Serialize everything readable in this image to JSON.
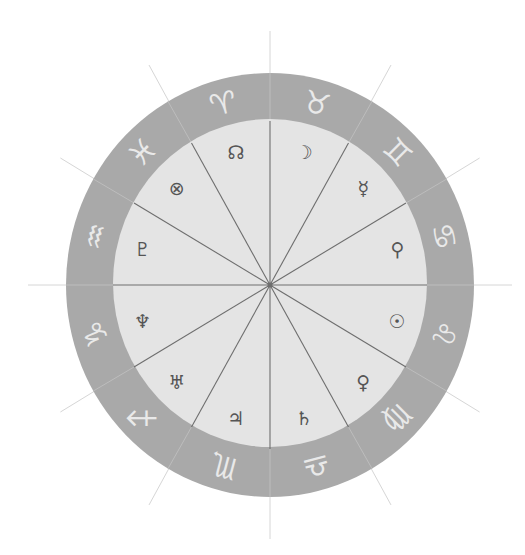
{
  "chart": {
    "center": {
      "x": 270,
      "y": 285
    },
    "outer_radius_x": 204,
    "outer_radius_y": 212,
    "inner_radius_x": 157,
    "inner_radius_y": 164,
    "tick_outer_radius_x": 242,
    "tick_outer_radius_y": 254,
    "colors": {
      "background": "#ffffff",
      "ring": "#a9a9a9",
      "inner_disk": "#e4e4e4",
      "spoke": "#6e6e6e",
      "tick": "#d6d6d6",
      "ring_divider": "#bdbdbd",
      "sign_glyph": "#e9e9e9",
      "body_glyph": "#555555"
    }
  },
  "zodiac_signs": [
    {
      "name": "aries",
      "glyph": "♈",
      "angle": -15
    },
    {
      "name": "taurus",
      "glyph": "♉",
      "angle": 15
    },
    {
      "name": "gemini",
      "glyph": "♊",
      "angle": 45
    },
    {
      "name": "cancer",
      "glyph": "♋",
      "angle": 75
    },
    {
      "name": "leo",
      "glyph": "♌",
      "angle": 105
    },
    {
      "name": "virgo",
      "glyph": "♍",
      "angle": 135
    },
    {
      "name": "libra",
      "glyph": "♎",
      "angle": 165
    },
    {
      "name": "scorpio",
      "glyph": "♏",
      "angle": 195
    },
    {
      "name": "sagittarius",
      "glyph": "♐",
      "angle": 225
    },
    {
      "name": "capricorn",
      "glyph": "♑",
      "angle": 255
    },
    {
      "name": "aquarius",
      "glyph": "♒",
      "angle": 285
    },
    {
      "name": "pisces",
      "glyph": "♓",
      "angle": 315
    }
  ],
  "houses": [
    {
      "name": "north-node",
      "glyph": "☊",
      "angle": -15
    },
    {
      "name": "moon",
      "glyph": "☽",
      "angle": 15
    },
    {
      "name": "mercury-variant",
      "glyph": "☿",
      "angle": 45
    },
    {
      "name": "venus-variant",
      "glyph": "⚲",
      "angle": 75
    },
    {
      "name": "sun",
      "glyph": "☉",
      "angle": 105
    },
    {
      "name": "venus-arrow",
      "glyph": "♀",
      "angle": 135
    },
    {
      "name": "saturn",
      "glyph": "♄",
      "angle": 165
    },
    {
      "name": "jupiter",
      "glyph": "♃",
      "angle": 195
    },
    {
      "name": "uranus",
      "glyph": "♅",
      "angle": 225
    },
    {
      "name": "neptune",
      "glyph": "♆",
      "angle": 255
    },
    {
      "name": "pluto",
      "glyph": "♇",
      "angle": 285
    },
    {
      "name": "part-of-fortune",
      "glyph": "⊗",
      "angle": 315
    }
  ],
  "sign_label_radius_ratio": 0.885,
  "body_label_radius_ratio": 0.84
}
